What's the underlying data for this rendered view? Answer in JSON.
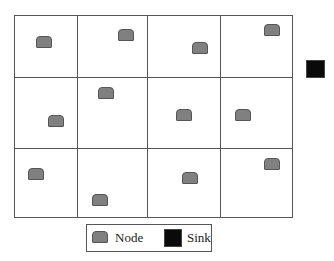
{
  "diagram": {
    "grid": {
      "rows": 3,
      "cols": 4
    },
    "colors": {
      "node": "#808080",
      "node_border": "#555555",
      "sink": "#0a0a0a",
      "grid_line": "#555555"
    },
    "nodes": [
      {
        "id": 1,
        "cell": [
          0,
          0
        ],
        "x": 36,
        "y": 36
      },
      {
        "id": 2,
        "cell": [
          0,
          1
        ],
        "x": 118,
        "y": 29
      },
      {
        "id": 3,
        "cell": [
          0,
          2
        ],
        "x": 192,
        "y": 42
      },
      {
        "id": 4,
        "cell": [
          0,
          3
        ],
        "x": 264,
        "y": 24
      },
      {
        "id": 5,
        "cell": [
          1,
          0
        ],
        "x": 48,
        "y": 115
      },
      {
        "id": 6,
        "cell": [
          1,
          1
        ],
        "x": 98,
        "y": 87
      },
      {
        "id": 7,
        "cell": [
          1,
          2
        ],
        "x": 176,
        "y": 109
      },
      {
        "id": 8,
        "cell": [
          1,
          3
        ],
        "x": 235,
        "y": 109
      },
      {
        "id": 9,
        "cell": [
          2,
          0
        ],
        "x": 28,
        "y": 168
      },
      {
        "id": 10,
        "cell": [
          2,
          1
        ],
        "x": 92,
        "y": 194
      },
      {
        "id": 11,
        "cell": [
          2,
          2
        ],
        "x": 182,
        "y": 172
      },
      {
        "id": 12,
        "cell": [
          2,
          3
        ],
        "x": 264,
        "y": 158
      }
    ],
    "sink": {
      "x": 306,
      "y": 60
    }
  },
  "legend": {
    "node_label": "Node",
    "sink_label": "Sink"
  }
}
